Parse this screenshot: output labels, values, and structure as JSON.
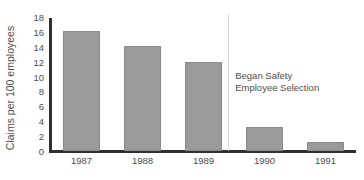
{
  "chart_data": {
    "type": "bar",
    "title": "",
    "xlabel": "",
    "ylabel": "Claims per 100 employees",
    "categories": [
      "1987",
      "1988",
      "1989",
      "1990",
      "1991"
    ],
    "values": [
      16.2,
      14.2,
      12.0,
      3.2,
      1.2
    ],
    "ylim": [
      0,
      18
    ],
    "yticks": [
      0,
      2,
      4,
      6,
      8,
      10,
      12,
      14,
      16,
      18
    ],
    "ytick_labels": [
      "0",
      "2",
      "4",
      "6",
      "8",
      "10",
      "12",
      "14",
      "16",
      "18"
    ],
    "grid": false,
    "legend": false,
    "bar_color": "#9a9a9a",
    "axis_color": "#2f2f2f",
    "annotations": [
      {
        "name": "intervention-note",
        "line1": "Began Safety",
        "line2": "Employee Selection",
        "divider_after_category": "1989"
      }
    ]
  }
}
